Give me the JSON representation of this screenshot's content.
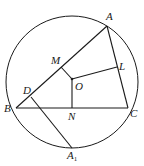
{
  "diagram": {
    "type": "geometry",
    "circle": {
      "cx": 72,
      "cy": 82,
      "r": 66
    },
    "points": {
      "A": {
        "label": "A",
        "x": 107,
        "y": 26
      },
      "B": {
        "label": "B",
        "x": 16,
        "y": 108
      },
      "C": {
        "label": "C",
        "x": 128,
        "y": 108
      },
      "M": {
        "label": "M",
        "x": 61,
        "y": 67
      },
      "O": {
        "label": "O",
        "x": 72,
        "y": 79
      },
      "L": {
        "label": "L",
        "x": 117,
        "y": 67
      },
      "N": {
        "label": "N",
        "x": 72,
        "y": 108
      },
      "D": {
        "label": "D",
        "x": 31,
        "y": 97
      },
      "A1": {
        "label": "A",
        "subscript": "1",
        "x": 72,
        "y": 148
      }
    },
    "segments": [
      [
        "A",
        "B"
      ],
      [
        "B",
        "C"
      ],
      [
        "C",
        "A"
      ],
      [
        "O",
        "M"
      ],
      [
        "O",
        "L"
      ],
      [
        "O",
        "N"
      ],
      [
        "D",
        "A1"
      ]
    ],
    "labels": {
      "A": "A",
      "B": "B",
      "C": "C",
      "M": "M",
      "O": "O",
      "L": "L",
      "N": "N",
      "D": "D",
      "A1_main": "A",
      "A1_sub": "1"
    }
  }
}
